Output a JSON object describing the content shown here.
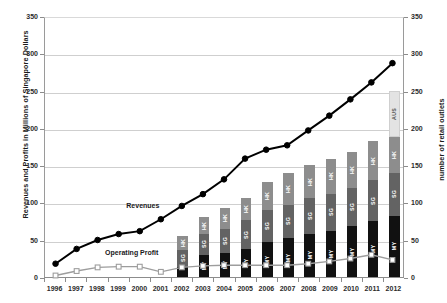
{
  "chart_data": {
    "type": "bar",
    "title": "",
    "subtitle": "",
    "ylabel": "Revenues and Profits in Millions of Singapore Dollars",
    "ylabel_secondary": "number of retail outlets",
    "xlabel": "",
    "ylim": [
      0,
      350
    ],
    "ylim_secondary": [
      0,
      350
    ],
    "yticks": [
      0,
      50,
      100,
      150,
      200,
      250,
      300,
      350
    ],
    "yticks_secondary": [
      0,
      50,
      100,
      150,
      200,
      250,
      300,
      350
    ],
    "grid": true,
    "legend_position": "inline-annotation",
    "categories": [
      "1996",
      "1997",
      "1998",
      "1999",
      "2000",
      "2001",
      "2002",
      "2003",
      "2004",
      "2005",
      "2006",
      "2007",
      "2008",
      "2009",
      "2010",
      "2011",
      "2012"
    ],
    "series": [
      {
        "name": "Revenues",
        "type": "line",
        "axis": "left",
        "color": "#000000",
        "marker": "filled-circle",
        "values": [
          18,
          38,
          50,
          58,
          62,
          78,
          96,
          112,
          132,
          160,
          172,
          178,
          198,
          218,
          240,
          263,
          289
        ]
      },
      {
        "name": "Operating Profit",
        "type": "line",
        "axis": "left",
        "color": "#9d9d9d",
        "marker": "hollow-square",
        "values": [
          2,
          8,
          13,
          14,
          14,
          7,
          13,
          15,
          16,
          16,
          16,
          16,
          18,
          21,
          25,
          30,
          23
        ]
      },
      {
        "name": "MY",
        "type": "bar-segment",
        "axis": "right",
        "color": "#111111",
        "text_color": "#ffffff",
        "values": [
          0,
          0,
          0,
          0,
          0,
          0,
          14,
          30,
          32,
          38,
          47,
          52,
          58,
          62,
          68,
          75,
          82
        ]
      },
      {
        "name": "SG",
        "type": "bar-segment",
        "axis": "right",
        "color": "#636363",
        "text_color": "#ffffff",
        "values": [
          0,
          0,
          0,
          0,
          0,
          0,
          22,
          28,
          33,
          38,
          43,
          45,
          48,
          50,
          52,
          55,
          58
        ]
      },
      {
        "name": "HK",
        "type": "bar-segment",
        "axis": "right",
        "color": "#8d8d8d",
        "text_color": "#ffffff",
        "values": [
          0,
          0,
          0,
          0,
          0,
          0,
          19,
          22,
          28,
          30,
          38,
          42,
          44,
          46,
          48,
          52,
          48
        ]
      },
      {
        "name": "AUS",
        "type": "bar-segment",
        "axis": "right",
        "color": "#e3e3e3",
        "text_color": "#555555",
        "values": [
          0,
          0,
          0,
          0,
          0,
          0,
          0,
          0,
          0,
          0,
          0,
          0,
          0,
          0,
          0,
          0,
          62
        ]
      }
    ],
    "annotations": [
      {
        "text": "Revenues",
        "x_category": "2000",
        "value": 96
      },
      {
        "text": "Operating Profit",
        "x_category": "1999",
        "value": 34
      }
    ],
    "bar_segment_order_bottom_to_top": [
      "MY",
      "SG",
      "HK",
      "AUS"
    ]
  },
  "colors": {
    "background": "#ffffff",
    "grid": "#cfcfcf",
    "axis": "#8c8c8c",
    "revenues_line": "#000000",
    "operating_profit_line": "#9d9d9d",
    "seg_my": "#111111",
    "seg_sg": "#636363",
    "seg_hk": "#8d8d8d",
    "seg_aus": "#e3e3e3"
  }
}
